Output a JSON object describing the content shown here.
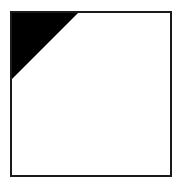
{
  "figure": {
    "name": "square-with-shaded-top-left-corner",
    "canvas": {
      "width": 182,
      "height": 188,
      "background_color": "#ffffff"
    },
    "square": {
      "label": "square-outline",
      "x": 11,
      "y": 12,
      "width": 160,
      "height": 164,
      "stroke_color": "#1a1a1a",
      "stroke_width": 2.2,
      "fill_color": "#ffffff"
    },
    "shaded_region": {
      "label": "black-right-triangle",
      "shape": "triangle",
      "fill_color": "#000000",
      "corner": "top-left",
      "points": "11,12 79,12 11,80",
      "leg_length": 68,
      "fraction_of_square": "about one quarter"
    }
  }
}
